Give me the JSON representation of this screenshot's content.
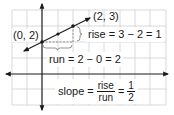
{
  "diagram": {
    "type": "slope-of-line",
    "grid": {
      "spacing_px": 15.5,
      "color": "#c8c8c8"
    },
    "axes": {
      "color": "#1a1a1a",
      "x_axis_arrows": "both",
      "y_axis_arrows": "both"
    },
    "points": [
      {
        "label": "(0, 2)",
        "x": 0,
        "y": 2
      },
      {
        "label": "(2, 3)",
        "x": 2,
        "y": 3
      }
    ],
    "midpoint": {
      "x": 1,
      "y": 2.5
    },
    "line_color": "#1a1a1a",
    "dashed_color": "#7a7a7a"
  },
  "labels": {
    "point_a": "(0, 2)",
    "point_b": "(2, 3)",
    "rise": "rise = 3 − 2 = 1",
    "run": "run = 2 − 0 = 2",
    "slope_prefix": "slope =",
    "slope_frac_num": "rise",
    "slope_frac_den": "run",
    "slope_eq": "=",
    "slope_value_num": "1",
    "slope_value_den": "2"
  }
}
